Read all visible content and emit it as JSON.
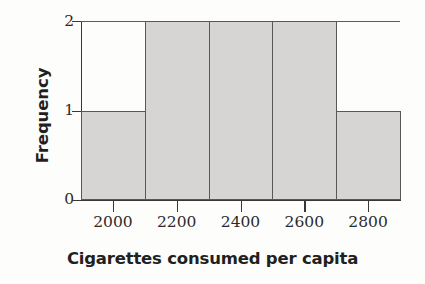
{
  "chart_data": {
    "type": "bar",
    "title": "",
    "subtitle": "",
    "xlabel": "Cigarettes consumed per capita",
    "ylabel": "Frequency",
    "categories": [
      "2000",
      "2200",
      "2400",
      "2600",
      "2800"
    ],
    "bin_edges": [
      1900,
      2100,
      2300,
      2500,
      2700,
      2900
    ],
    "values": [
      1,
      2,
      2,
      2,
      1
    ],
    "xlim": [
      1900,
      2900
    ],
    "ylim": [
      0,
      2
    ],
    "x_ticks": [
      "2000",
      "2200",
      "2400",
      "2600",
      "2800"
    ],
    "y_ticks": [
      "0",
      "1",
      "2"
    ],
    "grid": false,
    "legend": null,
    "annotations": [],
    "series": [
      {
        "name": "Frequency",
        "values": [
          1,
          2,
          2,
          2,
          1
        ]
      }
    ],
    "colors": {
      "bar_fill": "#d6d5d3",
      "bar_border": "#5a5857",
      "axis": "#3a3837",
      "text": "#221f1f",
      "tick_text": "#2d2a2a",
      "background": "#fdfdfc",
      "top_frame_line": "#5d5b5a"
    }
  }
}
